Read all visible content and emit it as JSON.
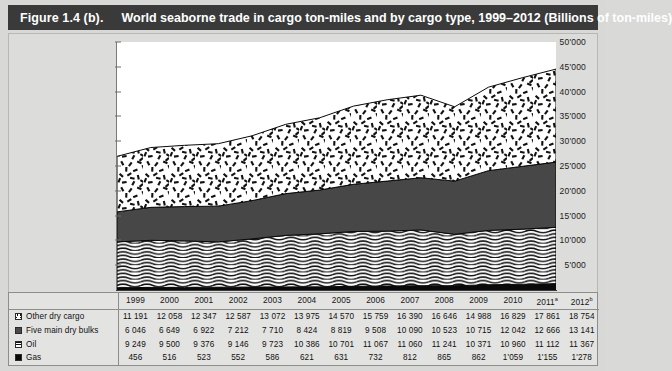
{
  "figure": {
    "number": "Figure 1.4 (b).",
    "title": "World seaborne trade in cargo ton-miles and by cargo type, 1999–2012 (Billions of ton-miles)"
  },
  "chart_data": {
    "type": "area",
    "title": "World seaborne trade in cargo ton-miles and by cargo type, 1999–2012 (Billions of ton-miles)",
    "xlabel": "",
    "ylabel": "",
    "ylim": [
      0,
      50000
    ],
    "yticks": [
      "5'000",
      "10'000",
      "15'000",
      "20'000",
      "25'000",
      "30'000",
      "35'000",
      "40'000",
      "45'000",
      "50'000"
    ],
    "ytick_values": [
      5000,
      10000,
      15000,
      20000,
      25000,
      30000,
      35000,
      40000,
      45000,
      50000
    ],
    "grid": false,
    "stacked": true,
    "legend_position": "table-left",
    "categories": [
      "1999",
      "2000",
      "2001",
      "2002",
      "2003",
      "2004",
      "2005",
      "2006",
      "2007",
      "2008",
      "2009",
      "2010",
      "2011",
      "2012"
    ],
    "category_labels": [
      "1999",
      "2000",
      "2001",
      "2002",
      "2003",
      "2004",
      "2005",
      "2006",
      "2007",
      "2008",
      "2009",
      "2010",
      "2011ᵃ",
      "2012ᵇ"
    ],
    "series": [
      {
        "name": "Gas",
        "pattern": "solid-black",
        "color": "#0a0a0a",
        "values": [
          456,
          516,
          523,
          552,
          586,
          621,
          631,
          732,
          812,
          865,
          862,
          1059,
          1155,
          1278
        ]
      },
      {
        "name": "Oil",
        "pattern": "wavy-lines",
        "color": "#111111",
        "values": [
          9249,
          9500,
          9376,
          9146,
          9723,
          10386,
          10701,
          11067,
          11060,
          11241,
          10371,
          10960,
          11112,
          11367
        ]
      },
      {
        "name": "Five main dry bulks",
        "pattern": "solid-dark-gray",
        "color": "#474747",
        "values": [
          6046,
          6649,
          6922,
          7212,
          7710,
          8424,
          8819,
          9508,
          10090,
          10523,
          10715,
          12042,
          12666,
          13141
        ]
      },
      {
        "name": "Other dry cargo",
        "pattern": "scattered-dashes",
        "color": "#141414",
        "values": [
          11191,
          12058,
          12347,
          12587,
          13072,
          13975,
          14570,
          15759,
          16390,
          16646,
          14988,
          16829,
          17861,
          18754
        ]
      }
    ]
  },
  "table": {
    "corner_label": "",
    "columns": [
      "1999",
      "2000",
      "2001",
      "2002",
      "2003",
      "2004",
      "2005",
      "2006",
      "2007",
      "2008",
      "2009",
      "2010",
      "2011",
      "2012"
    ],
    "column_notes": [
      "",
      "",
      "",
      "",
      "",
      "",
      "",
      "",
      "",
      "",
      "",
      "",
      "a",
      "b"
    ],
    "rows": [
      {
        "label": "Other dry cargo",
        "swatch": "dash-pattern-icon",
        "values": [
          "11 191",
          "12 058",
          "12 347",
          "12 587",
          "13 072",
          "13 975",
          "14 570",
          "15 759",
          "16 390",
          "16 646",
          "14 988",
          "16 829",
          "17 861",
          "18 754"
        ]
      },
      {
        "label": "Five main dry bulks",
        "swatch": "gray-fill-icon",
        "values": [
          "6 046",
          "6 649",
          "6 922",
          "7 212",
          "7 710",
          "8 424",
          "8 819",
          "9 508",
          "10 090",
          "10 523",
          "10 715",
          "12 042",
          "12 666",
          "13 141"
        ]
      },
      {
        "label": "Oil",
        "swatch": "wave-pattern-icon",
        "values": [
          "9 249",
          "9 500",
          "9 376",
          "9 146",
          "9 723",
          "10 386",
          "10 701",
          "11 067",
          "11 060",
          "11 241",
          "10 371",
          "10 960",
          "11 112",
          "11 367"
        ]
      },
      {
        "label": "Gas",
        "swatch": "black-fill-icon",
        "values": [
          "456",
          "516",
          "523",
          "552",
          "586",
          "621",
          "631",
          "732",
          "812",
          "865",
          "862",
          "1'059",
          "1'155",
          "1'278"
        ]
      }
    ]
  }
}
